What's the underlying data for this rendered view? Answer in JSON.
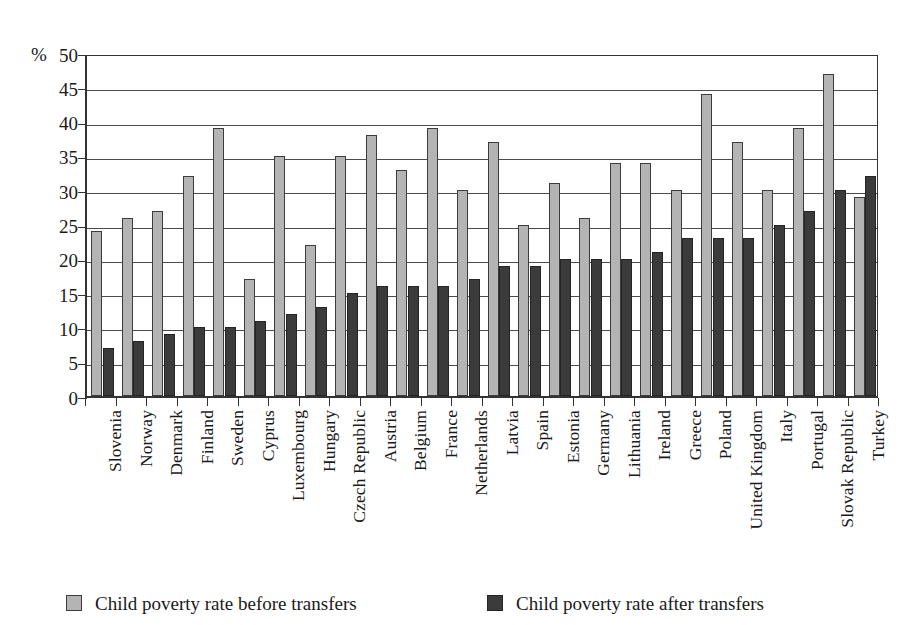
{
  "chart_data": {
    "type": "bar",
    "title": "",
    "subtitle": "",
    "xlabel": "",
    "ylabel": "%",
    "ylim": [
      0,
      50
    ],
    "ytick_step": 5,
    "yticks": [
      "0",
      "5",
      "10",
      "15",
      "20",
      "25",
      "30",
      "35",
      "40",
      "45",
      "50"
    ],
    "grid": true,
    "legend_position": "bottom",
    "categories": [
      "Slovenia",
      "Norway",
      "Denmark",
      "Finland",
      "Sweden",
      "Cyprus",
      "Luxembourg",
      "Hungary",
      "Czech Republic",
      "Austria",
      "Belgium",
      "France",
      "Netherlands",
      "Latvia",
      "Spain",
      "Estonia",
      "Germany",
      "Lithuania",
      "Ireland",
      "Greece",
      "Poland",
      "United Kingdom",
      "Italy",
      "Portugal",
      "Slovak Republic",
      "Turkey"
    ],
    "series": [
      {
        "name": "Child poverty rate before transfers",
        "color": "#b4b4b4",
        "values": [
          24,
          26,
          27,
          32,
          39,
          17,
          35,
          22,
          35,
          38,
          33,
          39,
          30,
          37,
          25,
          31,
          26,
          34,
          34,
          30,
          44,
          37,
          30,
          39,
          47,
          29
        ]
      },
      {
        "name": "Child poverty rate after transfers",
        "color": "#3b3b3b",
        "values": [
          7,
          8,
          9,
          10,
          10,
          11,
          12,
          13,
          15,
          16,
          16,
          16,
          17,
          19,
          19,
          20,
          20,
          20,
          21,
          23,
          23,
          23,
          25,
          27,
          30,
          32
        ]
      }
    ]
  },
  "legend": {
    "entries": [
      {
        "label": "Child poverty rate before transfers",
        "swatch": "before"
      },
      {
        "label": "Child poverty rate after transfers",
        "swatch": "after"
      }
    ]
  }
}
